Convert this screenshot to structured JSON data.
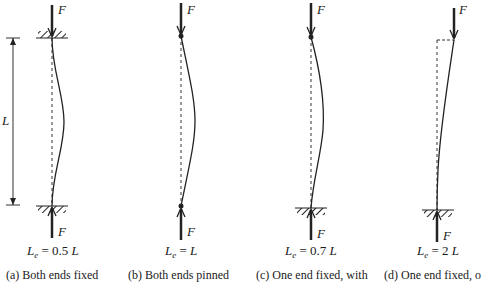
{
  "figure": {
    "force_label": "F",
    "length_label": "L",
    "columns": [
      {
        "id": "a",
        "le_prefix": "L",
        "le_sub": "e",
        "le_eq": " = 0.5 ",
        "le_unit": "L",
        "caption": "(a) Both ends fixed",
        "top_support": "fixed",
        "bottom_support": "fixed"
      },
      {
        "id": "b",
        "le_prefix": "L",
        "le_sub": "e",
        "le_eq": " = ",
        "le_unit": "L",
        "caption": "(b) Both ends pinned",
        "top_support": "pinned",
        "bottom_support": "pinned"
      },
      {
        "id": "c",
        "le_prefix": "L",
        "le_sub": "e",
        "le_eq": " = 0.7 ",
        "le_unit": "L",
        "caption": "(c) One end fixed, with",
        "top_support": "pinned",
        "bottom_support": "fixed"
      },
      {
        "id": "d",
        "le_prefix": "L",
        "le_sub": "e",
        "le_eq": " = 2 ",
        "le_unit": "L",
        "caption": "(d) One end fixed, o",
        "top_support": "free",
        "bottom_support": "fixed"
      }
    ]
  }
}
